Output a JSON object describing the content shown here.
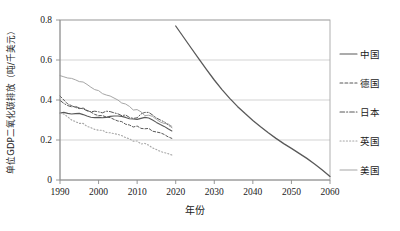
{
  "chart_data": {
    "type": "line",
    "title": "",
    "xlabel": "年份",
    "ylabel": "单位GDP二氧化碳排放（吨/千美元）",
    "xlim": [
      1990,
      2060
    ],
    "ylim": [
      0,
      0.8
    ],
    "grid": true,
    "legend_position": "right",
    "x_ticks": [
      "1990",
      "2000",
      "2010",
      "2020",
      "2030",
      "2040",
      "2050",
      "2060"
    ],
    "x_tick_values": [
      1990,
      2000,
      2010,
      2020,
      2030,
      2040,
      2050,
      2060
    ],
    "y_ticks": [
      "0",
      "0.2",
      "0.4",
      "0.6",
      "0.8"
    ],
    "y_tick_values": [
      0,
      0.2,
      0.4,
      0.6,
      0.8
    ],
    "series": [
      {
        "name": "中国",
        "style": "solid",
        "color": "#595959",
        "width": 1.1,
        "x": [
          1990,
          1991,
          1992,
          1993,
          1994,
          1995,
          1996,
          1997,
          1998,
          1999,
          2000,
          2001,
          2002,
          2003,
          2004,
          2005,
          2006,
          2007,
          2008,
          2009,
          2010,
          2011,
          2012,
          2013,
          2014,
          2015,
          2016,
          2017,
          2018,
          2019
        ],
        "values": [
          0.335,
          0.338,
          0.333,
          0.33,
          0.332,
          0.333,
          0.327,
          0.32,
          0.314,
          0.312,
          0.313,
          0.311,
          0.313,
          0.318,
          0.32,
          0.32,
          0.318,
          0.313,
          0.306,
          0.305,
          0.303,
          0.308,
          0.313,
          0.31,
          0.3,
          0.288,
          0.277,
          0.268,
          0.256,
          0.245
        ]
      },
      {
        "name": "中国",
        "style": "solid",
        "color": "#595959",
        "width": 1.3,
        "projection": true,
        "x": [
          2020,
          2022,
          2024,
          2026,
          2028,
          2030,
          2032,
          2034,
          2036,
          2038,
          2040,
          2042,
          2044,
          2046,
          2048,
          2050,
          2052,
          2054,
          2056,
          2058,
          2060
        ],
        "values": [
          0.77,
          0.715,
          0.66,
          0.606,
          0.552,
          0.5,
          0.452,
          0.408,
          0.368,
          0.332,
          0.298,
          0.266,
          0.236,
          0.208,
          0.182,
          0.158,
          0.133,
          0.108,
          0.08,
          0.05,
          0.018
        ]
      },
      {
        "name": "德国",
        "style": "dashed",
        "color": "#595959",
        "width": 1.0,
        "x": [
          1990,
          1991,
          1992,
          1993,
          1994,
          1995,
          1996,
          1997,
          1998,
          1999,
          2000,
          2001,
          2002,
          2003,
          2004,
          2005,
          2006,
          2007,
          2008,
          2009,
          2010,
          2011,
          2012,
          2013,
          2014,
          2015,
          2016,
          2017,
          2018,
          2019
        ],
        "values": [
          0.42,
          0.4,
          0.38,
          0.372,
          0.363,
          0.357,
          0.36,
          0.348,
          0.34,
          0.328,
          0.322,
          0.322,
          0.315,
          0.312,
          0.303,
          0.295,
          0.292,
          0.279,
          0.275,
          0.265,
          0.27,
          0.258,
          0.256,
          0.258,
          0.244,
          0.24,
          0.236,
          0.228,
          0.216,
          0.208
        ]
      },
      {
        "name": "日本",
        "style": "dashdot",
        "color": "#595959",
        "width": 1.0,
        "x": [
          1990,
          1991,
          1992,
          1993,
          1994,
          1995,
          1996,
          1997,
          1998,
          1999,
          2000,
          2001,
          2002,
          2003,
          2004,
          2005,
          2006,
          2007,
          2008,
          2009,
          2010,
          2011,
          2012,
          2013,
          2014,
          2015,
          2016,
          2017,
          2018,
          2019
        ],
        "values": [
          0.398,
          0.383,
          0.372,
          0.366,
          0.368,
          0.36,
          0.356,
          0.346,
          0.341,
          0.344,
          0.341,
          0.336,
          0.344,
          0.342,
          0.336,
          0.331,
          0.322,
          0.325,
          0.313,
          0.308,
          0.311,
          0.33,
          0.338,
          0.338,
          0.325,
          0.31,
          0.3,
          0.291,
          0.276,
          0.262
        ]
      },
      {
        "name": "英国",
        "style": "dotted",
        "color": "#a6a6a6",
        "width": 1.1,
        "x": [
          1990,
          1991,
          1992,
          1993,
          1994,
          1995,
          1996,
          1997,
          1998,
          1999,
          2000,
          2001,
          2002,
          2003,
          2004,
          2005,
          2006,
          2007,
          2008,
          2009,
          2010,
          2011,
          2012,
          2013,
          2014,
          2015,
          2016,
          2017,
          2018,
          2019
        ],
        "values": [
          0.333,
          0.33,
          0.316,
          0.3,
          0.292,
          0.283,
          0.283,
          0.268,
          0.262,
          0.253,
          0.249,
          0.249,
          0.238,
          0.236,
          0.232,
          0.228,
          0.222,
          0.212,
          0.206,
          0.194,
          0.195,
          0.18,
          0.183,
          0.174,
          0.16,
          0.152,
          0.143,
          0.137,
          0.132,
          0.125
        ]
      },
      {
        "name": "美国",
        "style": "solid",
        "color": "#a6a6a6",
        "width": 1.0,
        "x": [
          1990,
          1991,
          1992,
          1993,
          1994,
          1995,
          1996,
          1997,
          1998,
          1999,
          2000,
          2001,
          2002,
          2003,
          2004,
          2005,
          2006,
          2007,
          2008,
          2009,
          2010,
          2011,
          2012,
          2013,
          2014,
          2015,
          2016,
          2017,
          2018,
          2019
        ],
        "values": [
          0.522,
          0.516,
          0.51,
          0.508,
          0.501,
          0.492,
          0.49,
          0.478,
          0.464,
          0.452,
          0.447,
          0.432,
          0.425,
          0.42,
          0.41,
          0.4,
          0.385,
          0.38,
          0.368,
          0.35,
          0.352,
          0.341,
          0.322,
          0.324,
          0.318,
          0.303,
          0.29,
          0.283,
          0.281,
          0.268
        ]
      }
    ],
    "legend": [
      {
        "label": "中国",
        "style": "solid",
        "color": "#595959"
      },
      {
        "label": "德国",
        "style": "dashed",
        "color": "#595959"
      },
      {
        "label": "日本",
        "style": "dashdot",
        "color": "#595959"
      },
      {
        "label": "英国",
        "style": "dotted",
        "color": "#a6a6a6"
      },
      {
        "label": "美国",
        "style": "solid",
        "color": "#a6a6a6"
      }
    ]
  }
}
